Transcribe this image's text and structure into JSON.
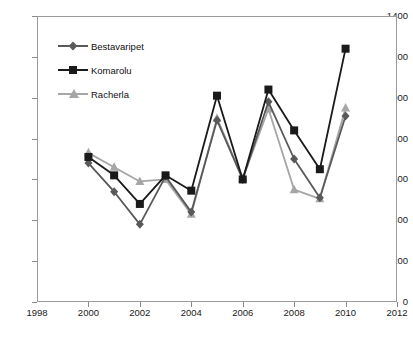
{
  "chart_data": {
    "type": "line",
    "title": "",
    "xlabel": "",
    "ylabel": "",
    "xlim": [
      1998,
      2012
    ],
    "ylim": [
      0,
      1400
    ],
    "grid": false,
    "legend_position": "top-left",
    "x": [
      2000,
      2001,
      2002,
      2003,
      2004,
      2005,
      2006,
      2007,
      2008,
      2009,
      2010
    ],
    "xticks": [
      "1998",
      "2000",
      "2002",
      "2004",
      "2006",
      "2008",
      "2010",
      "2012"
    ],
    "xtick_values": [
      1998,
      2000,
      2002,
      2004,
      2006,
      2008,
      2010,
      2012
    ],
    "yticks": [
      "0",
      "200",
      "400",
      "600",
      "800",
      "1000",
      "1200",
      "1400"
    ],
    "ytick_values": [
      0,
      200,
      400,
      600,
      800,
      1000,
      1200,
      1400
    ],
    "series": [
      {
        "name": "Bestavaripet",
        "color": "#595959",
        "marker": "diamond",
        "values": [
          680,
          540,
          380,
          615,
          440,
          890,
          600,
          980,
          700,
          510,
          910
        ]
      },
      {
        "name": "Komarolu",
        "color": "#1a1a1a",
        "marker": "square",
        "values": [
          710,
          620,
          480,
          620,
          545,
          1010,
          600,
          1040,
          840,
          650,
          1240
        ]
      },
      {
        "name": "Racherla",
        "color": "#a6a6a6",
        "marker": "triangle",
        "values": [
          730,
          660,
          590,
          600,
          430,
          900,
          605,
          945,
          550,
          505,
          950
        ]
      }
    ]
  },
  "axes": {
    "frame_color": "#9a9a9a",
    "tick_color": "#8a8a8a",
    "label_color": "#1a1a1a"
  }
}
